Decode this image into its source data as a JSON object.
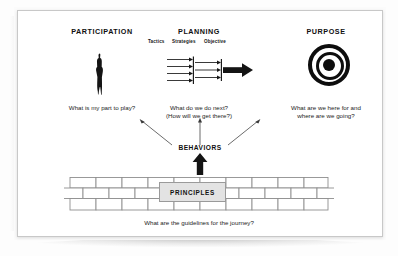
{
  "diagram": {
    "title_visible": false,
    "columns": [
      {
        "id": "participation",
        "heading": "PARTICIPATION",
        "icon": "person-silhouette-icon",
        "question": "What is my part to play?"
      },
      {
        "id": "planning",
        "heading": "PLANNING",
        "icon": "converging-arrows-icon",
        "stage_labels": [
          "Tactics",
          "Strategies",
          "Objective"
        ],
        "question_line1": "What do we do next?",
        "question_line2": "(How will we get there?)"
      },
      {
        "id": "purpose",
        "heading": "PURPOSE",
        "icon": "bullseye-target-icon",
        "question_line1": "What are we here for and",
        "question_line2": "where are we going?"
      }
    ],
    "behaviors": {
      "label": "BEHAVIORS",
      "outgoing_arrows": [
        "to-participation",
        "to-planning",
        "to-purpose"
      ],
      "incoming_arrow": "from-principles"
    },
    "foundation": {
      "label": "PRINCIPLES",
      "question": "What are the guidelines for the journey?",
      "wall_rows": 3,
      "wall_icon": "brick-wall-icon"
    },
    "colors": {
      "ink": "#101010",
      "paper": "#ffffff",
      "principles_fill": "#e3e3e3",
      "brick_stroke": "#8f8f8f"
    }
  }
}
